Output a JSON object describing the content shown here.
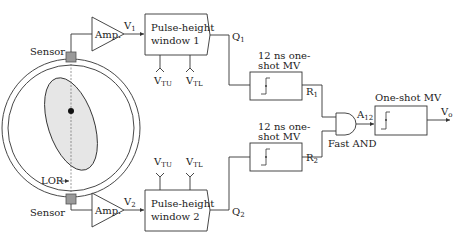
{
  "diagram": {
    "type": "PET coincidence detection circuit",
    "colors": {
      "line": "#333333",
      "sensor_fill": "#9a9a9a",
      "ellipse_fill": "#e6e6e6",
      "background": "#ffffff"
    },
    "scanner": {
      "sensor_top_label": "Sensor",
      "sensor_bottom_label": "Sensor",
      "lor_label": "LOR"
    },
    "channel1": {
      "amp_label": "Amp.",
      "signal_v": "V",
      "signal_v_sub": "1",
      "window_line1": "Pulse-height",
      "window_line2": "window 1",
      "vtu": "V",
      "vtu_sub": "TU",
      "vtl": "V",
      "vtl_sub": "TL",
      "q": "Q",
      "q_sub": "1",
      "mv_line1": "12 ns one-",
      "mv_line2": "shot MV",
      "r": "R",
      "r_sub": "1"
    },
    "channel2": {
      "amp_label": "Amp.",
      "signal_v": "V",
      "signal_v_sub": "2",
      "window_line1": "Pulse-height",
      "window_line2": "window 2",
      "vtu": "V",
      "vtu_sub": "TU",
      "vtl": "V",
      "vtl_sub": "TL",
      "q": "Q",
      "q_sub": "2",
      "mv_line1": "12 ns one-",
      "mv_line2": "shot MV",
      "r": "R",
      "r_sub": "2"
    },
    "coincidence": {
      "gate_label": "Fast AND",
      "a": "A",
      "a_sub": "12",
      "output_mv_label": "One-shot MV",
      "output": "V",
      "output_sub": "o"
    }
  }
}
